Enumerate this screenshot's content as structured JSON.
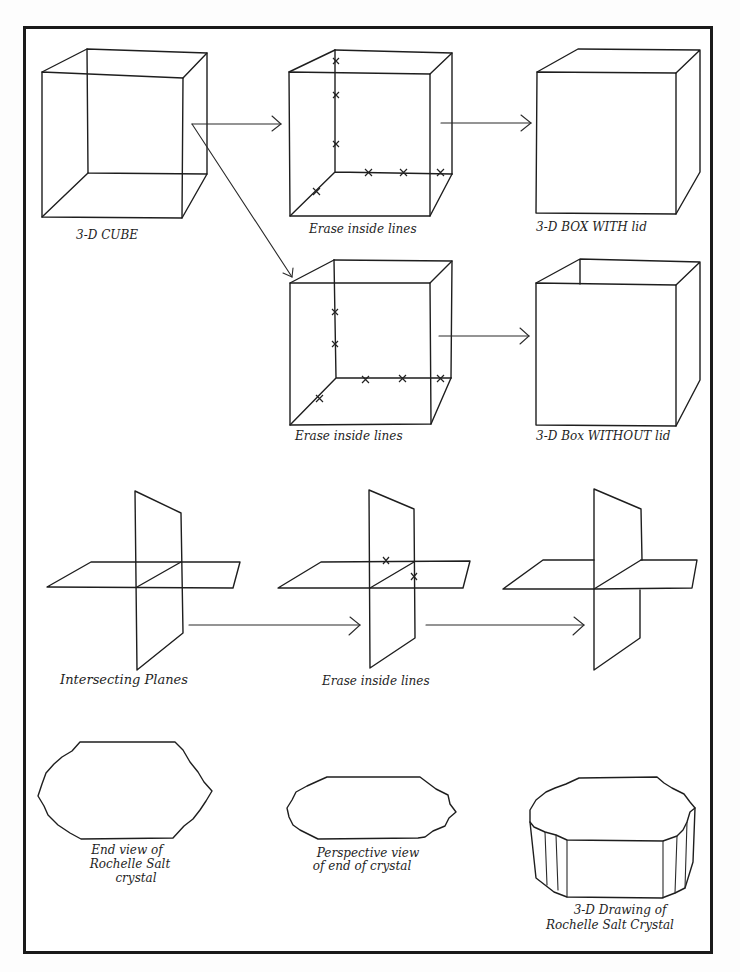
{
  "diagram": {
    "title": "",
    "sections": [
      {
        "name": "cube-to-box",
        "steps": [
          {
            "id": "cube",
            "label": "3-D CUBE"
          },
          {
            "id": "erase-top",
            "label": "Erase inside lines"
          },
          {
            "id": "box-with-lid",
            "label": "3-D BOX WITH lid"
          },
          {
            "id": "erase-bottom",
            "label": "Erase inside lines"
          },
          {
            "id": "box-without-lid",
            "label": "3-D Box WITHOUT lid"
          }
        ]
      },
      {
        "name": "planes",
        "steps": [
          {
            "id": "intersecting-planes",
            "label": "Intersecting Planes"
          },
          {
            "id": "planes-erase",
            "label": "Erase inside lines"
          },
          {
            "id": "planes-result",
            "label": ""
          }
        ]
      },
      {
        "name": "crystal",
        "steps": [
          {
            "id": "end-view",
            "label_lines": [
              "End view of",
              "Rochelle Salt",
              "crystal"
            ]
          },
          {
            "id": "perspective-view",
            "label_lines": [
              "Perspective view",
              "of end of crystal"
            ]
          },
          {
            "id": "3d-drawing",
            "label_lines": [
              "3-D Drawing of",
              "Rochelle Salt Crystal"
            ]
          }
        ]
      }
    ],
    "colors": {
      "ink": "#1e1e1e",
      "paper": "#ffffff",
      "border": "#1a1a1a"
    }
  }
}
